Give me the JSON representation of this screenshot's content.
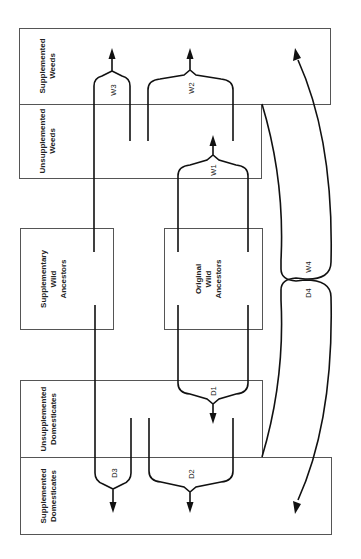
{
  "diagram": {
    "title": "",
    "orientation": "rotated 90 degrees counter-clockwise",
    "nodes": [
      {
        "id": "supplemented_weeds",
        "lines": [
          "Supplemented",
          "Weeds"
        ]
      },
      {
        "id": "unsupplemented_weeds",
        "lines": [
          "Unsupplemented",
          "Weeds"
        ]
      },
      {
        "id": "supplementary_wild_ancestors",
        "lines": [
          "Supplementary",
          "Wild",
          "Ancestors"
        ]
      },
      {
        "id": "original_wild_ancestors",
        "lines": [
          "Original",
          "Wild",
          "Ancestors"
        ]
      },
      {
        "id": "unsupplemented_domesticates",
        "lines": [
          "Unsupplemented",
          "Domesticates"
        ]
      },
      {
        "id": "supplemented_domesticates",
        "lines": [
          "Supplemented",
          "Domesticates"
        ]
      }
    ],
    "edges": [
      {
        "label": "W1",
        "from": [
          "original_wild_ancestors"
        ],
        "to": "unsupplemented_weeds"
      },
      {
        "label": "W2",
        "from": [
          "unsupplemented_weeds",
          "unsupplemented_weeds"
        ],
        "to": "supplemented_weeds"
      },
      {
        "label": "W3",
        "from": [
          "supplementary_wild_ancestors",
          "unsupplemented_weeds"
        ],
        "to": "supplemented_weeds"
      },
      {
        "label": "W4",
        "from": [
          "unsupplemented_domesticates"
        ],
        "to": "supplemented_weeds"
      },
      {
        "label": "D1",
        "from": [
          "original_wild_ancestors"
        ],
        "to": "unsupplemented_domesticates"
      },
      {
        "label": "D2",
        "from": [
          "unsupplemented_domesticates",
          "unsupplemented_domesticates"
        ],
        "to": "supplemented_domesticates"
      },
      {
        "label": "D3",
        "from": [
          "supplementary_wild_ancestors",
          "unsupplemented_domesticates"
        ],
        "to": "supplemented_domesticates"
      },
      {
        "label": "D4",
        "from": [
          "unsupplemented_weeds"
        ],
        "to": "supplemented_domesticates"
      }
    ]
  },
  "labels": {
    "sw1": "Supplemented",
    "sw2": "Weeds",
    "uw1": "Unsupplemented",
    "uw2": "Weeds",
    "swa1": "Supplementary",
    "swa2": "Wild",
    "swa3": "Ancestors",
    "owa1": "Original",
    "owa2": "Wild",
    "owa3": "Ancestors",
    "ud1": "Unsupplemented",
    "ud2": "Domesticates",
    "sd1": "Supplemented",
    "sd2": "Domesticates",
    "w1": "W1",
    "w2": "W2",
    "w3": "W3",
    "w4": "W4",
    "d1": "D1",
    "d2": "D2",
    "d3": "D3",
    "d4": "D4"
  }
}
